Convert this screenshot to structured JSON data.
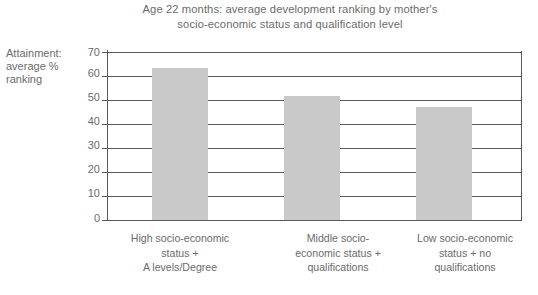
{
  "chart_data": {
    "type": "bar",
    "title": "Age 22 months: average development ranking by mother's\nsocio-economic status and qualification level",
    "xlabel": "",
    "ylabel": "Attainment:\naverage %\nranking",
    "categories": [
      "High socio-economic\nstatus +\nA levels/Degree",
      "Middle socio-\neconomic status +\nqualifications",
      "Low socio-economic\nstatus + no\nqualifications"
    ],
    "values": [
      63.5,
      51.5,
      47
    ],
    "ylim": [
      0,
      70
    ],
    "yticks": [
      70,
      60,
      50,
      40,
      30,
      20,
      10,
      0
    ],
    "ytick_labels": [
      "70",
      "60",
      "50",
      "40",
      "30",
      "20",
      "10",
      "0"
    ],
    "grid": true,
    "legend": false,
    "bar_color": "#c9c9c9",
    "axis_color": "#58595b",
    "text_color": "#6b6b6b"
  }
}
